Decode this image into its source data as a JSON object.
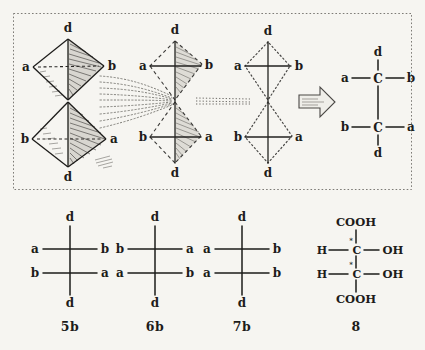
{
  "figure": {
    "background_color": "#f6f5f1",
    "ink_color": "#1d1c1a"
  },
  "top_panel": {
    "frame": "dotted-rectangle",
    "structures": [
      {
        "id": "tetrahedra-pair",
        "kind": "double-tetrahedron",
        "upper": {
          "apex": "d",
          "left": "a",
          "right": "b"
        },
        "lower": {
          "apex": "d",
          "left": "b",
          "right": "a"
        }
      },
      {
        "id": "flattened-pair",
        "kind": "flattened-tetrahedron",
        "upper": {
          "top": "d",
          "left": "a",
          "right": "b"
        },
        "lower": {
          "bottom": "d",
          "left": "b",
          "right": "a"
        }
      },
      {
        "id": "cross-projection",
        "kind": "dotted-diamond-cross",
        "upper": {
          "top": "d",
          "left": "a",
          "right": "b"
        },
        "lower": {
          "bottom": "d",
          "left": "b",
          "right": "a"
        }
      },
      {
        "id": "fischer-with-carbons",
        "kind": "fischer-projection",
        "center_atoms": [
          "C",
          "C"
        ],
        "upper": {
          "top": "d",
          "left": "a",
          "right": "b"
        },
        "lower": {
          "bottom": "d",
          "left": "b",
          "right": "a"
        }
      }
    ]
  },
  "bottom_row": {
    "structures": [
      {
        "caption": "5b",
        "top": "d",
        "upper_left": "a",
        "upper_right": "b",
        "lower_left": "b",
        "lower_right": "a",
        "bottom": "d"
      },
      {
        "caption": "6b",
        "top": "d",
        "upper_left": "b",
        "upper_right": "a",
        "lower_left": "a",
        "lower_right": "b",
        "bottom": "d"
      },
      {
        "caption": "7b",
        "top": "d",
        "upper_left": "a",
        "upper_right": "b",
        "lower_left": "a",
        "lower_right": "b",
        "bottom": "d"
      },
      {
        "caption": "8",
        "top": "COOH",
        "upper_left": "H",
        "upper_center": "C",
        "upper_center_mark": "*",
        "upper_right": "OH",
        "lower_left": "H",
        "lower_center": "C",
        "lower_center_mark": "*",
        "lower_right": "OH",
        "bottom": "COOH"
      }
    ]
  }
}
